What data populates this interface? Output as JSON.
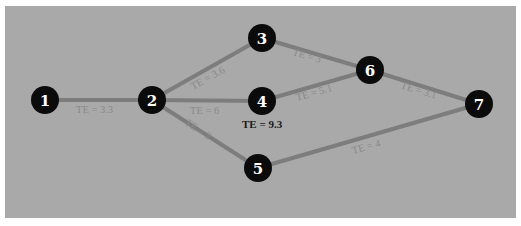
{
  "diagram": {
    "type": "PERT network",
    "nodes": [
      {
        "id": "1",
        "label": "1",
        "x": 45,
        "y": 100
      },
      {
        "id": "2",
        "label": "2",
        "x": 152,
        "y": 100
      },
      {
        "id": "3",
        "label": "3",
        "x": 262,
        "y": 38
      },
      {
        "id": "4",
        "label": "4",
        "x": 262,
        "y": 101
      },
      {
        "id": "5",
        "label": "5",
        "x": 258,
        "y": 168
      },
      {
        "id": "6",
        "label": "6",
        "x": 370,
        "y": 70
      },
      {
        "id": "7",
        "label": "7",
        "x": 479,
        "y": 104
      }
    ],
    "edges": [
      {
        "from": "1",
        "to": "2",
        "label": "TE = 3.3"
      },
      {
        "from": "2",
        "to": "3",
        "label": "TE = 3.6"
      },
      {
        "from": "2",
        "to": "4",
        "label": "TE = 6"
      },
      {
        "from": "2",
        "to": "5",
        "label": "TE = 2"
      },
      {
        "from": "3",
        "to": "6",
        "label": "TE = 3"
      },
      {
        "from": "4",
        "to": "6",
        "label": "TE = 5.1"
      },
      {
        "from": "6",
        "to": "7",
        "label": "TE = 3.1"
      },
      {
        "from": "5",
        "to": "7",
        "label": "TE = 4"
      }
    ],
    "node_annotations": [
      {
        "node": "4",
        "label": "TE = 9.3"
      }
    ],
    "colors": {
      "background": "#a9a9a9",
      "edge": "#7d7d7d",
      "node_fill": "#0b0b0b",
      "node_text": "#ffffff",
      "edge_label": "#8a8a8a"
    }
  }
}
